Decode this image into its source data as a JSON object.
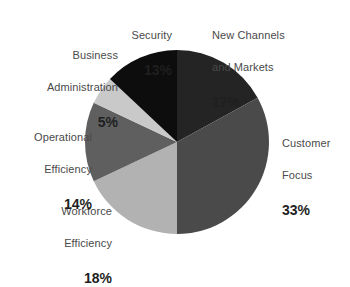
{
  "chart_data": {
    "type": "pie",
    "title": "",
    "subtitle": "",
    "xlabel": "",
    "ylabel": "",
    "legend_position": "radial-outside-labels",
    "grid": false,
    "value_suffix": "%",
    "start_angle_deg": 0,
    "direction": "clockwise",
    "categories": [
      "New Channels and Markets",
      "Customer Focus",
      "Workforce Efficiency",
      "Operational Efficiency",
      "Business Administration",
      "Security"
    ],
    "values": [
      17,
      33,
      18,
      14,
      5,
      13
    ],
    "colors": [
      "#242424",
      "#4a4a4a",
      "#b2b2b2",
      "#5f5f5f",
      "#c9c9c9",
      "#0d0d0d"
    ],
    "slices": [
      {
        "label": "New Channels\nand Markets",
        "label_line1": "New Channels",
        "label_line2": "and Markets",
        "value": 17,
        "value_text": "17%",
        "color": "#242424"
      },
      {
        "label": "Customer\nFocus",
        "label_line1": "Customer",
        "label_line2": "Focus",
        "value": 33,
        "value_text": "33%",
        "color": "#4a4a4a"
      },
      {
        "label": "Workforce\nEfficiency",
        "label_line1": "Workforce",
        "label_line2": "Efficiency",
        "value": 18,
        "value_text": "18%",
        "color": "#b2b2b2"
      },
      {
        "label": "Operational\nEfficiency",
        "label_line1": "Operational",
        "label_line2": "Efficiency",
        "value": 14,
        "value_text": "14%",
        "color": "#5f5f5f"
      },
      {
        "label": "Business\nAdministration",
        "label_line1": "Business",
        "label_line2": "Administration",
        "value": 5,
        "value_text": "5%",
        "color": "#c9c9c9"
      },
      {
        "label": "Security",
        "label_line1": "Security",
        "label_line2": "",
        "value": 13,
        "value_text": "13%",
        "color": "#0d0d0d"
      }
    ]
  },
  "geometry": {
    "center_x": 177,
    "center_y": 142,
    "radius": 92
  },
  "style": {
    "background": "#ffffff",
    "label_text_color": "#4a4a4a",
    "value_text_color": "#1f1f1f"
  }
}
